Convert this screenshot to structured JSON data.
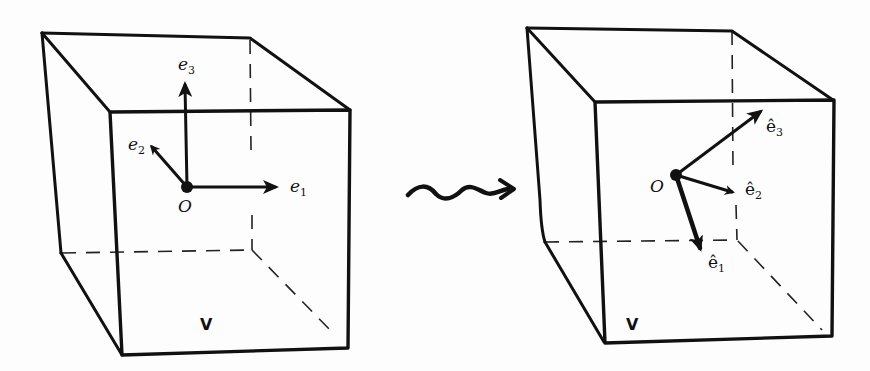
{
  "diagram": {
    "left_cube": {
      "volume_label": "V",
      "origin_label": "O",
      "vectors": [
        {
          "name": "e",
          "subscript": "1"
        },
        {
          "name": "e",
          "subscript": "2"
        },
        {
          "name": "e",
          "subscript": "3"
        }
      ]
    },
    "transition_symbol": "wavy-arrow",
    "right_cube": {
      "volume_label": "V",
      "origin_label": "O",
      "vectors": [
        {
          "name": "ê",
          "subscript": "1"
        },
        {
          "name": "ê",
          "subscript": "2"
        },
        {
          "name": "ê",
          "subscript": "3"
        }
      ]
    },
    "colors": {
      "ink": "#111111",
      "paper": "#fdfdfd"
    }
  }
}
